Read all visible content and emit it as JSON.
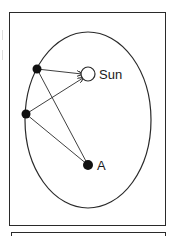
{
  "diagram": {
    "type": "orbital-geometry",
    "labels": {
      "sun": "Sun",
      "point_a": "A"
    },
    "ellipse": {
      "cx": 88,
      "cy": 120,
      "rx": 63,
      "ry": 88
    },
    "sun": {
      "x": 88,
      "y": 74,
      "r": 7
    },
    "point_a": {
      "x": 88,
      "y": 165,
      "r": 5
    },
    "planet_positions": [
      {
        "x": 37,
        "y": 69,
        "r": 4.5
      },
      {
        "x": 26,
        "y": 114,
        "r": 4.5
      }
    ],
    "connections": [
      {
        "from": "planet_1",
        "to": "sun",
        "arrow": true
      },
      {
        "from": "planet_2",
        "to": "sun",
        "arrow": true
      },
      {
        "from": "planet_1",
        "to": "point_a",
        "arrow": false
      },
      {
        "from": "planet_2",
        "to": "point_a",
        "arrow": false
      }
    ],
    "colors": {
      "stroke": "#2a2a2a",
      "fill_dark": "#111111",
      "background": "#ffffff"
    }
  }
}
